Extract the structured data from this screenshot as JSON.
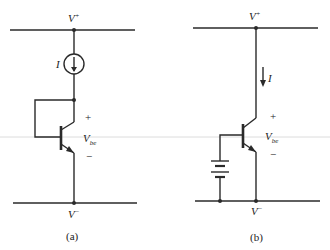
{
  "circuit_a": {
    "supply_top": "V",
    "supply_top_sup": "+",
    "supply_bottom": "V",
    "supply_bottom_sup": "−",
    "current_label": "I",
    "vbe_main": "V",
    "vbe_sub": "be",
    "plus": "+",
    "minus": "−",
    "caption": "(a)",
    "elements": [
      "current-source",
      "diode-connected-npn-transistor"
    ]
  },
  "circuit_b": {
    "supply_top": "V",
    "supply_top_sup": "+",
    "supply_bottom": "V",
    "supply_bottom_sup": "−",
    "current_label": "I",
    "vbe_main": "V",
    "vbe_sub": "be",
    "plus": "+",
    "minus": "−",
    "caption": "(b)",
    "elements": [
      "npn-transistor",
      "battery"
    ]
  },
  "colors": {
    "line": "#2a2a2a",
    "divider": "#cfcfcf"
  }
}
